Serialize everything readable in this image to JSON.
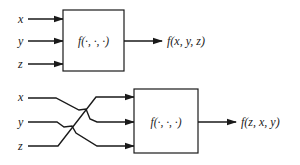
{
  "diagram": {
    "top": {
      "inputs": [
        "x",
        "y",
        "z"
      ],
      "box_label": "f(·, ·, ·)",
      "output_label": "f(x, y, z)"
    },
    "bottom": {
      "inputs": [
        "x",
        "y",
        "z"
      ],
      "box_label": "f(·, ·, ·)",
      "output_label": "f(z, x, y)",
      "wiring": {
        "x": "input 2",
        "y": "input 3",
        "z": "input 1"
      }
    },
    "colors": {
      "line": "#1a1a1a",
      "background": "#ffffff"
    }
  }
}
